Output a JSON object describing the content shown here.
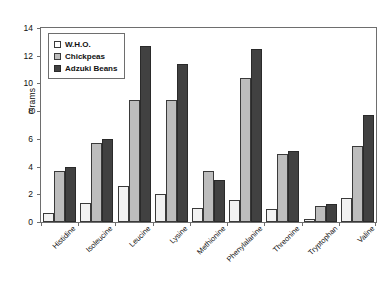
{
  "chart_data": {
    "type": "bar",
    "title": "",
    "xlabel": "",
    "ylabel": "Grams",
    "ylim": [
      0,
      14
    ],
    "ytick_step": 2,
    "yticks": [
      0,
      2,
      4,
      6,
      8,
      10,
      12,
      14
    ],
    "grid": false,
    "legend_position": "top-left-inside",
    "categories": [
      "Histidine",
      "Isoleucine",
      "Leucine",
      "Lysine",
      "Methionine",
      "Phenylalanine",
      "Threonine",
      "Tryptophan",
      "Valine"
    ],
    "series": [
      {
        "name": "W.H.O.",
        "color": "#ffffff",
        "values": [
          0.65,
          1.35,
          2.6,
          2.0,
          1.0,
          1.6,
          0.95,
          0.25,
          1.7
        ]
      },
      {
        "name": "Chickpeas",
        "color": "#bdbdbd",
        "values": [
          3.65,
          5.7,
          8.8,
          8.8,
          3.7,
          10.4,
          4.9,
          1.15,
          5.5
        ]
      },
      {
        "name": "Adzuki Beans",
        "color": "#414141",
        "values": [
          4.0,
          6.0,
          12.7,
          11.4,
          3.0,
          12.5,
          5.1,
          1.3,
          7.7
        ]
      }
    ]
  }
}
